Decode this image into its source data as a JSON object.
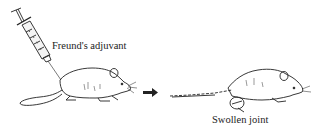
{
  "figure": {
    "stage1": {
      "label": "Freund's adjuvant",
      "description": "Syringe injecting adjuvant into rat"
    },
    "arrow": {
      "direction": "right"
    },
    "stage2": {
      "label": "Swollen joint",
      "description": "Rat with swollen hind joint"
    },
    "colors": {
      "line": "#222222",
      "background": "#ffffff"
    }
  }
}
